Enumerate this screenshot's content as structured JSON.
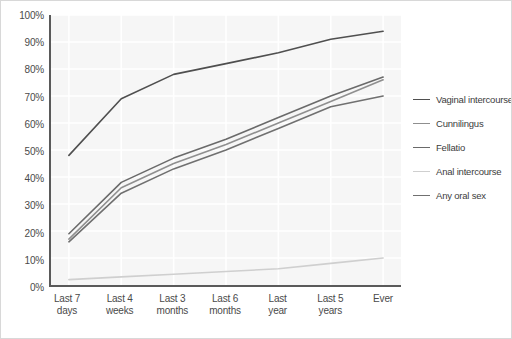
{
  "chart_data": {
    "type": "line",
    "title": "",
    "xlabel": "",
    "ylabel": "",
    "ylim": [
      0,
      100
    ],
    "grid": true,
    "legend_position": "right",
    "categories": [
      "Last 7\ndays",
      "Last 4\nweeks",
      "Last 3\nmonths",
      "Last 6\nmonths",
      "Last\nyear",
      "Last 5\nyears",
      "Ever"
    ],
    "ytick_labels": [
      "0%",
      "10%",
      "20%",
      "30%",
      "40%",
      "50%",
      "60%",
      "70%",
      "80%",
      "90%",
      "100%"
    ],
    "ytick_values": [
      0,
      10,
      20,
      30,
      40,
      50,
      60,
      70,
      80,
      90,
      100
    ],
    "series": [
      {
        "name": "Vaginal intercourse",
        "color": "#4f4f4f",
        "values": [
          48,
          69,
          78,
          82,
          86,
          91,
          94
        ]
      },
      {
        "name": "Cunnilingus",
        "color": "#8f8f8f",
        "values": [
          17,
          36,
          45,
          52,
          60,
          68,
          76
        ]
      },
      {
        "name": "Fellatio",
        "color": "#6a6a6a",
        "values": [
          19,
          38,
          47,
          54,
          62,
          70,
          77
        ]
      },
      {
        "name": "Anal intercourse",
        "color": "#cfcfcf",
        "values": [
          2,
          3,
          4,
          5,
          6,
          8,
          10
        ]
      },
      {
        "name": "Any oral sex",
        "color": "#707070",
        "values": [
          16,
          34,
          43,
          50,
          58,
          66,
          70
        ]
      }
    ]
  },
  "legend": {
    "items": [
      {
        "label": "Vaginal intercourse",
        "color": "#4f4f4f"
      },
      {
        "label": "Cunnilingus",
        "color": "#8f8f8f"
      },
      {
        "label": "Fellatio",
        "color": "#6a6a6a"
      },
      {
        "label": "Anal intercourse",
        "color": "#cfcfcf"
      },
      {
        "label": "Any oral sex",
        "color": "#707070"
      }
    ]
  },
  "style": {
    "plot_background": "#f6f6f6",
    "gridline_color": "#ffffff",
    "axis_color": "#5a5a5a",
    "text_color": "#4a4a4a",
    "figure_background": "#ffffff"
  }
}
